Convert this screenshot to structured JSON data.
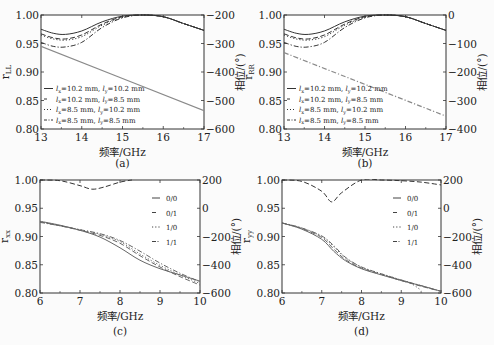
{
  "chart_data": [
    {
      "panel": "a",
      "type": "line",
      "caption": "(a)",
      "xlabel": "频率/GHz",
      "ylabel": "r_LL",
      "ylabel_right": "相位/(°)",
      "xlim": [
        13,
        17
      ],
      "ylim": [
        0.8,
        1.0
      ],
      "ylim_right": [
        -600,
        -200
      ],
      "xticks": [
        "13",
        "14",
        "15",
        "16",
        "17"
      ],
      "yticks": [
        "0.80",
        "0.85",
        "0.90",
        "0.95",
        "1.00"
      ],
      "yticks_right": [
        "−600",
        "−500",
        "−400",
        "−300",
        "−200"
      ],
      "legend_position": "lower left",
      "grid": false,
      "series": [
        {
          "name": "lx=10.2 mm, ly=10.2 mm",
          "style": "solid",
          "x": [
            13,
            13.3,
            13.6,
            14,
            14.5,
            15,
            15.5,
            16,
            16.5,
            17
          ],
          "y": [
            0.975,
            0.968,
            0.966,
            0.972,
            0.988,
            0.998,
            1.0,
            0.997,
            0.985,
            0.973
          ]
        },
        {
          "name": "lx=10.2 mm, ly=8.5 mm",
          "style": "dashed",
          "x": [
            13,
            13.3,
            13.6,
            14,
            14.5,
            15,
            15.5,
            16,
            16.5,
            17
          ],
          "y": [
            0.967,
            0.96,
            0.958,
            0.965,
            0.984,
            0.997,
            1.0,
            0.997,
            0.985,
            0.973
          ]
        },
        {
          "name": "lx=8.5 mm, ly=10.2 mm",
          "style": "dotted",
          "x": [
            13,
            13.3,
            13.6,
            14,
            14.5,
            15,
            15.5,
            16,
            16.5,
            17
          ],
          "y": [
            0.965,
            0.958,
            0.956,
            0.962,
            0.982,
            0.996,
            1.0,
            0.997,
            0.985,
            0.973
          ]
        },
        {
          "name": "lx=8.5 mm, ly=8.5 mm",
          "style": "dashdot",
          "x": [
            13,
            13.3,
            13.6,
            14,
            14.5,
            15,
            15.5,
            16,
            16.5,
            17
          ],
          "y": [
            0.952,
            0.945,
            0.944,
            0.952,
            0.978,
            0.995,
            1.0,
            0.997,
            0.985,
            0.973
          ]
        },
        {
          "name": "phase",
          "axis": "right",
          "style": "solid-gray",
          "x": [
            13,
            17
          ],
          "y": [
            -310,
            -536
          ]
        }
      ],
      "legend": [
        "lx=10.2 mm, ly=10.2 mm",
        "lx=10.2 mm, ly=8.5 mm",
        "lx=8.5 mm, ly=10.2 mm",
        "lx=8.5 mm, ly=8.5 mm"
      ]
    },
    {
      "panel": "b",
      "type": "line",
      "caption": "(b)",
      "xlabel": "频率/GHz",
      "ylabel": "r_RR",
      "ylabel_right": "相位/(°)",
      "xlim": [
        13,
        17
      ],
      "ylim": [
        0.8,
        1.0
      ],
      "ylim_right": [
        -400,
        0
      ],
      "xticks": [
        "13",
        "14",
        "15",
        "16",
        "17"
      ],
      "yticks": [
        "0.80",
        "0.85",
        "0.90",
        "0.95",
        "1.00"
      ],
      "yticks_right": [
        "−400",
        "−300",
        "−200",
        "−100",
        "0"
      ],
      "legend_position": "lower left",
      "grid": false,
      "series": [
        {
          "name": "lx=10.2 mm, ly=10.2 mm",
          "style": "solid",
          "x": [
            13,
            13.3,
            13.6,
            14,
            14.5,
            15,
            15.5,
            16,
            16.5,
            17
          ],
          "y": [
            0.975,
            0.968,
            0.966,
            0.972,
            0.988,
            0.998,
            1.0,
            0.997,
            0.985,
            0.973
          ]
        },
        {
          "name": "lx=10.2 mm, ly=8.5 mm",
          "style": "dashed",
          "x": [
            13,
            13.3,
            13.6,
            14,
            14.5,
            15,
            15.5,
            16,
            16.5,
            17
          ],
          "y": [
            0.967,
            0.96,
            0.958,
            0.965,
            0.984,
            0.997,
            1.0,
            0.997,
            0.985,
            0.973
          ]
        },
        {
          "name": "lx=8.5 mm, ly=10.2 mm",
          "style": "dotted",
          "x": [
            13,
            13.3,
            13.6,
            14,
            14.5,
            15,
            15.5,
            16,
            16.5,
            17
          ],
          "y": [
            0.965,
            0.958,
            0.956,
            0.962,
            0.982,
            0.996,
            1.0,
            0.997,
            0.985,
            0.973
          ]
        },
        {
          "name": "lx=8.5 mm, ly=8.5 mm",
          "style": "dashdot",
          "x": [
            13,
            13.3,
            13.6,
            14,
            14.5,
            15,
            15.5,
            16,
            16.5,
            17
          ],
          "y": [
            0.952,
            0.945,
            0.944,
            0.952,
            0.978,
            0.995,
            1.0,
            0.997,
            0.985,
            0.973
          ]
        },
        {
          "name": "phase",
          "axis": "right",
          "style": "dashdot-gray",
          "x": [
            13,
            17
          ],
          "y": [
            -132,
            -355
          ]
        }
      ],
      "legend": [
        "lx=10.2 mm, ly=10.2 mm",
        "lx=10.2 mm, ly=8.5 mm",
        "lx=8.5 mm, ly=10.2 mm",
        "lx=8.5 mm, ly=8.5 mm"
      ]
    },
    {
      "panel": "c",
      "type": "line",
      "caption": "(c)",
      "xlabel": "频率/GHz",
      "ylabel": "r_xx",
      "ylabel_right": "相位/(°)",
      "xlim": [
        6,
        10
      ],
      "ylim": [
        0.8,
        1.0
      ],
      "ylim_right": [
        -600,
        200
      ],
      "xticks": [
        "6",
        "7",
        "8",
        "9",
        "10"
      ],
      "yticks": [
        "0.80",
        "0.85",
        "0.90",
        "0.95",
        "1.00"
      ],
      "yticks_right": [
        "−600",
        "−400",
        "−200",
        "0",
        "200"
      ],
      "legend_position": "upper right",
      "grid": false,
      "series": [
        {
          "name": "0/0",
          "style": "solid",
          "x": [
            6,
            6.5,
            7,
            7.5,
            8,
            8.5,
            9,
            9.5,
            10
          ],
          "y": [
            0.927,
            0.92,
            0.911,
            0.899,
            0.88,
            0.858,
            0.843,
            0.832,
            0.821
          ]
        },
        {
          "name": "0/1",
          "style": "dashed",
          "x": [
            6,
            6.5,
            7,
            7.5,
            8,
            8.5,
            9,
            9.5,
            10
          ],
          "y": [
            0.926,
            0.919,
            0.911,
            0.902,
            0.888,
            0.866,
            0.846,
            0.829,
            0.814
          ]
        },
        {
          "name": "1/0",
          "style": "dotted",
          "x": [
            6,
            6.5,
            7,
            7.5,
            8,
            8.5,
            9,
            9.5,
            10
          ],
          "y": [
            0.926,
            0.919,
            0.912,
            0.904,
            0.891,
            0.869,
            0.849,
            0.832,
            0.817
          ]
        },
        {
          "name": "1/1",
          "style": "dashdot",
          "x": [
            6,
            6.5,
            7,
            7.5,
            8,
            8.5,
            9,
            9.5,
            10
          ],
          "y": [
            0.925,
            0.919,
            0.912,
            0.905,
            0.893,
            0.874,
            0.853,
            0.835,
            0.82
          ]
        },
        {
          "name": "phase",
          "axis": "right",
          "style": "dashed",
          "x": [
            6,
            6.5,
            7,
            7.3,
            7.6,
            8,
            8.3
          ],
          "y": [
            200,
            195,
            160,
            135,
            150,
            185,
            200
          ]
        }
      ],
      "legend": [
        "0/0",
        "0/1",
        "1/0",
        "1/1"
      ]
    },
    {
      "panel": "d",
      "type": "line",
      "caption": "(d)",
      "xlabel": "频率/GHz",
      "ylabel": "r_yy",
      "ylabel_right": "相位/(°)",
      "xlim": [
        6,
        10
      ],
      "ylim": [
        0.8,
        1.0
      ],
      "ylim_right": [
        -600,
        200
      ],
      "xticks": [
        "6",
        "7",
        "8",
        "9",
        "10"
      ],
      "yticks": [
        "0.80",
        "0.85",
        "0.90",
        "0.95",
        "1.00"
      ],
      "yticks_right": [
        "−600",
        "−400",
        "−200",
        "0",
        "200"
      ],
      "legend_position": "upper right",
      "grid": false,
      "series": [
        {
          "name": "0/0",
          "style": "solid",
          "x": [
            6,
            6.5,
            7,
            7.3,
            7.6,
            8,
            8.5,
            9,
            9.5,
            10
          ],
          "y": [
            0.924,
            0.913,
            0.895,
            0.874,
            0.857,
            0.843,
            0.832,
            0.822,
            0.813,
            0.803
          ]
        },
        {
          "name": "0/1",
          "style": "dashed",
          "x": [
            6,
            6.5,
            7,
            7.3,
            7.6,
            8,
            8.5,
            9,
            9.5,
            10
          ],
          "y": [
            0.924,
            0.914,
            0.898,
            0.878,
            0.859,
            0.844,
            0.833,
            0.822,
            0.812,
            0.803
          ]
        },
        {
          "name": "1/0",
          "style": "dotted",
          "x": [
            6,
            6.5,
            7,
            7.3,
            7.6,
            8,
            8.5,
            9,
            9.2,
            9.5
          ],
          "y": [
            0.924,
            0.915,
            0.9,
            0.882,
            0.862,
            0.846,
            0.834,
            0.823,
            0.819,
            0.805
          ]
        },
        {
          "name": "1/1",
          "style": "dashdot",
          "x": [
            6,
            6.5,
            7,
            7.3,
            7.6,
            8,
            8.5,
            9,
            9.5,
            10
          ],
          "y": [
            0.924,
            0.915,
            0.901,
            0.884,
            0.863,
            0.846,
            0.834,
            0.823,
            0.813,
            0.803
          ]
        },
        {
          "name": "phase",
          "axis": "right",
          "style": "dashed",
          "x": [
            6,
            6.5,
            7,
            7.25,
            7.5,
            8,
            8.5,
            9,
            9.5,
            10
          ],
          "y": [
            200,
            190,
            120,
            45,
            110,
            200,
            200,
            195,
            185,
            165
          ]
        }
      ],
      "legend": [
        "0/0",
        "0/1",
        "1/0",
        "1/1"
      ]
    }
  ],
  "panels": {
    "a": {
      "caption": "(a)",
      "xlabel": "频率/GHz",
      "ylabel_main": "r",
      "ylabel_sub": "LL",
      "ylabel_right": "相位/(°)",
      "xticks": [
        "13",
        "14",
        "15",
        "16",
        "17"
      ],
      "yticks": [
        "0.80",
        "0.85",
        "0.90",
        "0.95",
        "1.00"
      ],
      "yticks_right": [
        "−600",
        "−500",
        "−400",
        "−300",
        "−200"
      ],
      "legend": [
        {
          "lx": "=10.2 mm, ",
          "ly": "=10.2 mm"
        },
        {
          "lx": "=10.2 mm, ",
          "ly": "=8.5 mm"
        },
        {
          "lx": "=8.5 mm, ",
          "ly": "=10.2 mm"
        },
        {
          "lx": "=8.5 mm, ",
          "ly": "=8.5 mm"
        }
      ]
    },
    "b": {
      "caption": "(b)",
      "xlabel": "频率/GHz",
      "ylabel_main": "r",
      "ylabel_sub": "RR",
      "ylabel_right": "相位/(°)",
      "xticks": [
        "13",
        "14",
        "15",
        "16",
        "17"
      ],
      "yticks": [
        "0.80",
        "0.85",
        "0.90",
        "0.95",
        "1.00"
      ],
      "yticks_right": [
        "−400",
        "−300",
        "−200",
        "−100",
        "0"
      ],
      "legend": [
        {
          "lx": "=10.2 mm, ",
          "ly": "=10.2 mm"
        },
        {
          "lx": "=10.2 mm, ",
          "ly": "=8.5 mm"
        },
        {
          "lx": "=8.5 mm, ",
          "ly": "=10.2 mm"
        },
        {
          "lx": "=8.5 mm, ",
          "ly": "=8.5 mm"
        }
      ]
    },
    "c": {
      "caption": "(c)",
      "xlabel": "频率/GHz",
      "ylabel_main": "r",
      "ylabel_sub": "xx",
      "ylabel_right": "相位/(°)",
      "xticks": [
        "6",
        "7",
        "8",
        "9",
        "10"
      ],
      "yticks": [
        "0.80",
        "0.85",
        "0.90",
        "0.95",
        "1.00"
      ],
      "yticks_right": [
        "−600",
        "−400",
        "−200",
        "0",
        "200"
      ],
      "legend": [
        "0/0",
        "0/1",
        "1/0",
        "1/1"
      ]
    },
    "d": {
      "caption": "(d)",
      "xlabel": "频率/GHz",
      "ylabel_main": "r",
      "ylabel_sub": "yy",
      "ylabel_right": "相位/(°)",
      "xticks": [
        "6",
        "7",
        "8",
        "9",
        "10"
      ],
      "yticks": [
        "0.80",
        "0.85",
        "0.90",
        "0.95",
        "1.00"
      ],
      "yticks_right": [
        "−600",
        "−400",
        "−200",
        "0",
        "200"
      ],
      "legend": [
        "0/0",
        "0/1",
        "1/0",
        "1/1"
      ]
    }
  }
}
